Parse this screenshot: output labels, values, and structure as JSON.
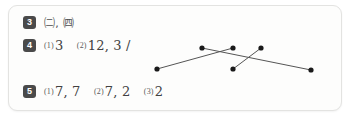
{
  "card": {
    "name": "answer-key-card",
    "background_color": "#fdfdfc",
    "border_color": "#e3e3e1"
  },
  "badge_color": "#4a4a4a",
  "text_color": "#4c4c4c",
  "rows": [
    {
      "number": "3",
      "answer_plain": "㈡, ㈣",
      "parts": []
    },
    {
      "number": "4",
      "parts": [
        {
          "label": "(1)",
          "value": "3"
        },
        {
          "label": "(2)",
          "value": "12, 3 /"
        }
      ]
    },
    {
      "number": "5",
      "parts": [
        {
          "label": "(1)",
          "value": "7, 7"
        },
        {
          "label": "(2)",
          "value": "7, 2"
        },
        {
          "label": "(3)",
          "value": "2"
        }
      ]
    }
  ],
  "diagram": {
    "name": "crossing-lines-matching-diagram",
    "line_color": "#555555",
    "dot_color": "#1a1a1a",
    "dot_radius": 2.6,
    "line_width": 1,
    "points": [
      {
        "id": "p-bottom-left",
        "x": 16,
        "y": 35
      },
      {
        "id": "p-top-left",
        "x": 61,
        "y": 14
      },
      {
        "id": "p-top-mid",
        "x": 92,
        "y": 14
      },
      {
        "id": "p-bottom-mid",
        "x": 92,
        "y": 35
      },
      {
        "id": "p-top-right",
        "x": 120,
        "y": 14
      },
      {
        "id": "p-bottom-right",
        "x": 170,
        "y": 36
      }
    ],
    "segments": [
      {
        "id": "seg-left-to-topmid",
        "x1": 16,
        "y1": 35,
        "x2": 92,
        "y2": 14
      },
      {
        "id": "seg-topleft-to-right",
        "x1": 61,
        "y1": 14,
        "x2": 170,
        "y2": 36
      },
      {
        "id": "seg-bottommid-to-topright",
        "x1": 92,
        "y1": 35,
        "x2": 120,
        "y2": 14
      }
    ]
  }
}
